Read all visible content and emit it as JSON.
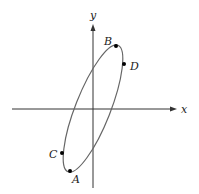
{
  "diagram": {
    "axes": {
      "x_label": "x",
      "y_label": "y",
      "color": "#333333"
    },
    "curve": {
      "shape": "ellipse",
      "color": "#666666",
      "center": [
        93,
        108.5
      ],
      "rx": 17.5,
      "ry": 68,
      "rotation_deg": 21.5
    },
    "points": [
      {
        "label": "A",
        "x": 70,
        "y": 171
      },
      {
        "label": "B",
        "x": 116,
        "y": 46
      },
      {
        "label": "C",
        "x": 62,
        "y": 153
      },
      {
        "label": "D",
        "x": 124,
        "y": 64
      }
    ]
  }
}
